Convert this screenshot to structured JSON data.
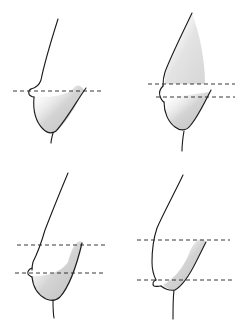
{
  "figure": {
    "type": "anatomical-line-illustration",
    "panel_count": 4,
    "layout": "2x2 grid",
    "colors": {
      "line": "#1a1a1a",
      "shading": "#9a9a9a",
      "background": "#ffffff"
    },
    "panels": [
      {
        "position": "top-left",
        "reference_lines": 1,
        "description": "side-profile contour, single dashed line at nipple level"
      },
      {
        "position": "top-right",
        "reference_lines": 2,
        "description": "side-profile contour, two dashed lines, nipple between/at lower line"
      },
      {
        "position": "bottom-left",
        "reference_lines": 2,
        "description": "side-profile contour, two dashed lines, nipple at lower line"
      },
      {
        "position": "bottom-right",
        "reference_lines": 2,
        "description": "side-profile contour, two widely spaced dashed lines, nipple below lower line"
      }
    ]
  }
}
